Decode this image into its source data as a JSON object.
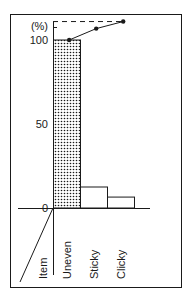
{
  "chart_data": {
    "type": "bar",
    "subtype": "pareto",
    "title": "",
    "ylabel": "(%)",
    "xlabel": "Item",
    "ylim": [
      0,
      100
    ],
    "yticks": [
      0,
      50,
      100
    ],
    "ytick_labels": [
      "0",
      "50",
      "100"
    ],
    "categories": [
      "Uneven",
      "Sticky",
      "Clicky"
    ],
    "series": [
      {
        "name": "Defect share",
        "kind": "bar",
        "values": [
          100,
          12.5,
          6.5
        ],
        "fills": [
          "dotted",
          "none",
          "none"
        ]
      },
      {
        "name": "Cumulative",
        "kind": "line",
        "values": [
          100,
          105,
          108
        ]
      }
    ],
    "reference_line": {
      "style": "dashed",
      "label": "(%)"
    },
    "grid": false,
    "legend": "none"
  },
  "colors": {
    "ink": "#1a1a1a",
    "background": "#ffffff"
  }
}
